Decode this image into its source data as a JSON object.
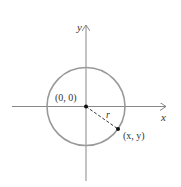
{
  "diagram": {
    "labels": {
      "y_axis": "y",
      "x_axis": "x",
      "origin": "(0, 0)",
      "radius": "r",
      "point": "(x, y)"
    },
    "colors": {
      "axis": "#888888",
      "circle": "#999999",
      "point": "#111111",
      "text": "#333333"
    }
  }
}
